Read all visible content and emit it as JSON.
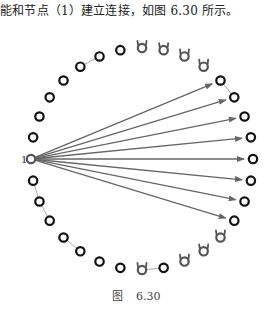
{
  "text": {
    "intro": "能和节点（1）建立连接，如图 6.30 所示。",
    "caption_prefix": "图",
    "caption_number": "6.30"
  },
  "diagram": {
    "type": "ring-network",
    "node_count": 32,
    "center": [
      142,
      159
    ],
    "radius": 111,
    "source_node_label": "1",
    "source_node_index": 0,
    "arrow_target_indices": [
      12,
      13,
      14,
      15,
      16,
      17,
      18,
      19
    ],
    "horned_node_indices": [
      8,
      9,
      10,
      11,
      20,
      21,
      22,
      24
    ],
    "neighbor_links": [
      [
        5,
        6
      ],
      [
        12,
        13
      ],
      [
        29,
        30
      ],
      [
        30,
        31
      ],
      [
        27,
        28
      ],
      [
        23,
        24
      ]
    ],
    "colors": {
      "node_stroke": "#111111",
      "horned_node_stroke": "#555555",
      "arrow": "#666666",
      "link": "#aaaaaa"
    }
  }
}
